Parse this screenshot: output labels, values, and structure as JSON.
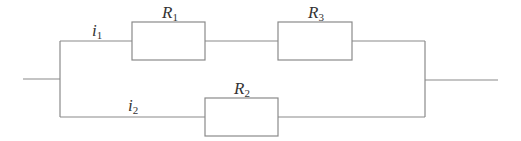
{
  "diagram": {
    "type": "circuit",
    "colors": {
      "wire": "#8a8a8a",
      "text": "#333333",
      "background": "#ffffff"
    },
    "components": [
      {
        "id": "R1",
        "symbol": "R",
        "subscript": "1",
        "branch": "upper"
      },
      {
        "id": "R3",
        "symbol": "R",
        "subscript": "3",
        "branch": "upper"
      },
      {
        "id": "R2",
        "symbol": "R",
        "subscript": "2",
        "branch": "lower"
      }
    ],
    "currents": [
      {
        "id": "i1",
        "symbol": "i",
        "subscript": "1",
        "branch": "upper"
      },
      {
        "id": "i2",
        "symbol": "i",
        "subscript": "2",
        "branch": "lower"
      }
    ]
  }
}
